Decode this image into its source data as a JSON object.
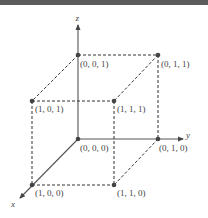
{
  "diagram": {
    "axes": {
      "x": {
        "label": "x"
      },
      "y": {
        "label": "y"
      },
      "z": {
        "label": "z"
      }
    },
    "vertices": [
      {
        "id": "v000",
        "label": "(0, 0, 0)"
      },
      {
        "id": "v010",
        "label": "(0, 1, 0)"
      },
      {
        "id": "v100",
        "label": "(1, 0, 0)"
      },
      {
        "id": "v110",
        "label": "(1, 1, 0)"
      },
      {
        "id": "v001",
        "label": "(0, 0, 1)"
      },
      {
        "id": "v011",
        "label": "(0, 1, 1)"
      },
      {
        "id": "v101",
        "label": "(1, 0, 1)"
      },
      {
        "id": "v111",
        "label": "(1, 1, 1)"
      }
    ],
    "colors": {
      "line": "#444444",
      "point": "#444444",
      "topbar": "#5c5c5c"
    }
  }
}
